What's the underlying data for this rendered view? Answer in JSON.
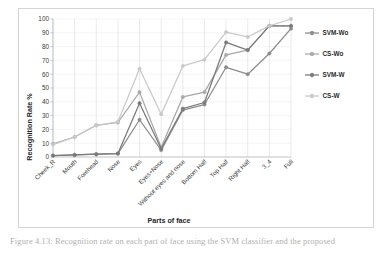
{
  "figure": {
    "caption_partial": "Figure 4.13: Recognition rate on each part of face using the SVM classifier and the proposed"
  },
  "chart_data": {
    "type": "line",
    "title": "",
    "xlabel": "Parts of face",
    "ylabel": "Recognition Rate %",
    "ylim": [
      0,
      100
    ],
    "ytick_step": 10,
    "yticks": [
      0,
      10,
      20,
      30,
      40,
      50,
      60,
      70,
      80,
      90,
      100
    ],
    "grid": true,
    "legend_position": "right",
    "categories": [
      "Cheek_R",
      "Mouth",
      "Forehead",
      "Nose",
      "Eyes",
      "Eyes+Nose",
      "Without eyes and nose",
      "Bottom Half",
      "Top Half",
      "Right Half",
      "3_4",
      "Full"
    ],
    "series": [
      {
        "name": "SVM-Wo",
        "color": "#8c8c8c",
        "marker": "circle",
        "values": [
          1,
          1.5,
          2,
          2.5,
          27,
          5,
          34,
          38,
          65,
          60,
          75,
          93
        ]
      },
      {
        "name": "CS-Wo",
        "color": "#a8a8a8",
        "marker": "circle",
        "values": [
          9.5,
          14.5,
          23,
          25,
          47,
          7,
          43.5,
          47,
          74,
          77.5,
          95,
          95
        ]
      },
      {
        "name": "SVM-W",
        "color": "#7a7a7a",
        "marker": "circle",
        "values": [
          1,
          1.5,
          2,
          2.5,
          39,
          6,
          35,
          39.5,
          83,
          77.5,
          95,
          95
        ]
      },
      {
        "name": "CS-W",
        "color": "#c9c9c9",
        "marker": "circle",
        "values": [
          9,
          14.5,
          23,
          25.5,
          64,
          31,
          66,
          70.5,
          90.5,
          87,
          95,
          100
        ]
      }
    ]
  },
  "legend": {
    "items": [
      {
        "label": "SVM-Wo"
      },
      {
        "label": "CS-Wo"
      },
      {
        "label": "SVM-W"
      },
      {
        "label": "CS-W"
      }
    ]
  }
}
